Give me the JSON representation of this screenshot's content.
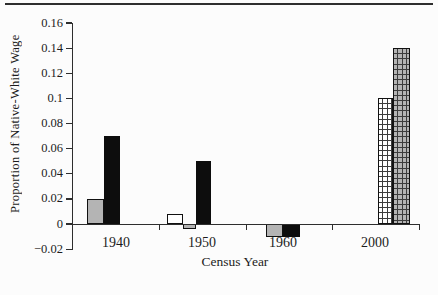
{
  "chart_data": {
    "type": "bar",
    "title": "",
    "xlabel": "Census Year",
    "ylabel": "Proportion of Native-White Wage",
    "ylim": [
      -0.02,
      0.16
    ],
    "grid": false,
    "legend": null,
    "y_ticks": [
      {
        "value": 0.16,
        "label": "0.16"
      },
      {
        "value": 0.14,
        "label": "0.14"
      },
      {
        "value": 0.12,
        "label": "0.12"
      },
      {
        "value": 0.1,
        "label": "0.1"
      },
      {
        "value": 0.08,
        "label": "0.08"
      },
      {
        "value": 0.06,
        "label": "0.06"
      },
      {
        "value": 0.04,
        "label": "0.04"
      },
      {
        "value": 0.02,
        "label": "0.02"
      },
      {
        "value": 0,
        "label": "0"
      },
      {
        "value": -0.02,
        "label": "−0.02"
      }
    ],
    "categories": [
      {
        "label": "1940",
        "center_px": 43
      },
      {
        "label": "1950",
        "center_px": 129
      },
      {
        "label": "1960",
        "center_px": 210
      },
      {
        "label": "2000",
        "center_px": 302
      }
    ],
    "bars": [
      {
        "category": "1940",
        "fill": "gray",
        "value": 0.02,
        "x_px": 14,
        "w_px": 17
      },
      {
        "category": "1940",
        "fill": "black",
        "value": 0.07,
        "x_px": 31,
        "w_px": 16
      },
      {
        "category": "1950",
        "fill": "white",
        "value": 0.008,
        "x_px": 94,
        "w_px": 16
      },
      {
        "category": "1950",
        "fill": "gray",
        "value": -0.004,
        "x_px": 110,
        "w_px": 13
      },
      {
        "category": "1950",
        "fill": "black",
        "value": 0.05,
        "x_px": 123,
        "w_px": 15
      },
      {
        "category": "1960",
        "fill": "gray",
        "value": -0.01,
        "x_px": 193,
        "w_px": 17
      },
      {
        "category": "1960",
        "fill": "black",
        "value": -0.01,
        "x_px": 210,
        "w_px": 17
      },
      {
        "category": "2000",
        "fill": "white-grid",
        "value": 0.1,
        "x_px": 305,
        "w_px": 15
      },
      {
        "category": "2000",
        "fill": "gray-grid",
        "value": 0.14,
        "x_px": 320,
        "w_px": 17
      }
    ],
    "x_boundary_ticks_px": [
      86,
      172.5,
      259,
      345.5
    ],
    "colors": {
      "gray_fill": "#b4b4b4",
      "black_fill": "#0d0d0d",
      "white_fill": "#ffffff",
      "hatch_line": "#3c3c3c",
      "axis_line": "#2e2e2e",
      "text": "#1c1c1c"
    }
  }
}
